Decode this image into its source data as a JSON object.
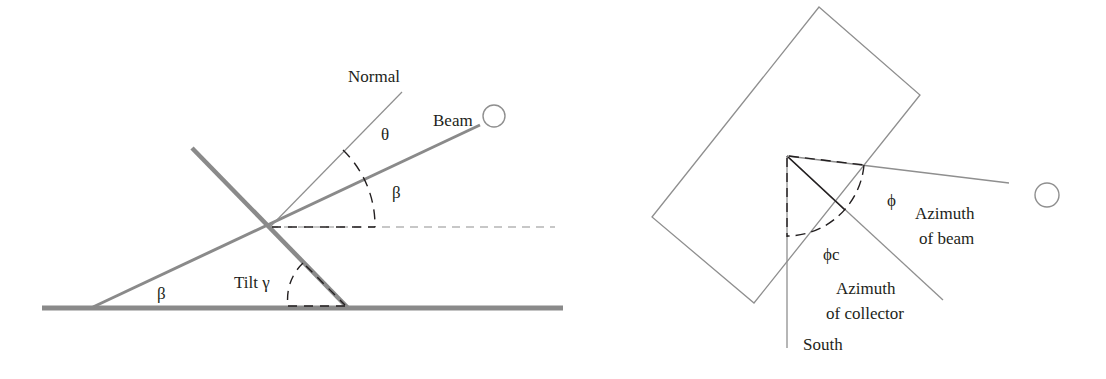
{
  "left_diagram": {
    "title": "Tilt angle geometry",
    "labels": {
      "normal": "Normal",
      "beam": "Beam",
      "theta": "θ",
      "beta_upper": "β",
      "beta_lower": "β",
      "tilt": "Tilt γ"
    }
  },
  "right_diagram": {
    "title": "Azimuth geometry",
    "labels": {
      "phi": "ϕ",
      "azimuth_beam_line1": "Azimuth",
      "azimuth_beam_line2": "of beam",
      "phi_c": "ϕc",
      "azimuth_collector_line1": "Azimuth",
      "azimuth_collector_line2": "of collector",
      "south": "South"
    }
  },
  "colors": {
    "thick_line": "#8a8a8a",
    "thin_line": "#8f8f8f",
    "dash": "#231f20",
    "text": "#231f20"
  }
}
